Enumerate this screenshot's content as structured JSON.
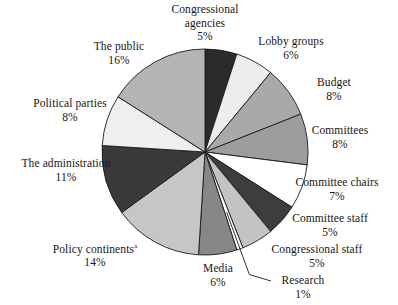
{
  "chart_data": {
    "type": "pie",
    "title": "",
    "subtitle": "",
    "xlabel": "",
    "ylabel": "",
    "legend_position": "labels-outside",
    "grid": false,
    "units": "percent",
    "total": 100,
    "start_angle_deg": 0,
    "direction": "clockwise",
    "footnote_marker": "a",
    "categories": [
      "Congressional agencies",
      "Lobby groups",
      "Budget",
      "Committees",
      "Committee chairs",
      "Committee staff",
      "Congressional staff",
      "Research",
      "Media",
      "Policy continents",
      "The administration",
      "Political parties",
      "The public"
    ],
    "values": [
      5,
      6,
      8,
      8,
      7,
      5,
      5,
      1,
      6,
      14,
      11,
      8,
      16
    ],
    "slices": [
      {
        "label": "Congressional agencies",
        "label_lines": [
          "Congressional",
          "agencies"
        ],
        "value": 5,
        "percent_text": "5%",
        "color": "#2b2b2b",
        "has_footnote": false,
        "leader_line": false,
        "label_x": 205,
        "label_y": 3,
        "label_align": "center"
      },
      {
        "label": "Lobby groups",
        "label_lines": [
          "Lobby groups"
        ],
        "value": 6,
        "percent_text": "6%",
        "color": "#ededed",
        "has_footnote": false,
        "leader_line": false,
        "label_x": 291,
        "label_y": 35,
        "label_align": "center"
      },
      {
        "label": "Budget",
        "label_lines": [
          "Budget"
        ],
        "value": 8,
        "percent_text": "8%",
        "color": "#a9a9a9",
        "has_footnote": false,
        "leader_line": false,
        "label_x": 334,
        "label_y": 76,
        "label_align": "center"
      },
      {
        "label": "Committees",
        "label_lines": [
          "Committees"
        ],
        "value": 8,
        "percent_text": "8%",
        "color": "#9d9d9d",
        "has_footnote": false,
        "leader_line": false,
        "label_x": 340,
        "label_y": 124,
        "label_align": "center"
      },
      {
        "label": "Committee chairs",
        "label_lines": [
          "Committee chairs"
        ],
        "value": 7,
        "percent_text": "7%",
        "color": "#ffffff",
        "has_footnote": false,
        "leader_line": false,
        "label_x": 337,
        "label_y": 176,
        "label_align": "center"
      },
      {
        "label": "Committee staff",
        "label_lines": [
          "Committee staff"
        ],
        "value": 5,
        "percent_text": "5%",
        "color": "#3d3d3d",
        "has_footnote": false,
        "leader_line": false,
        "label_x": 330,
        "label_y": 212,
        "label_align": "center"
      },
      {
        "label": "Congressional staff",
        "label_lines": [
          "Congressional staff"
        ],
        "value": 5,
        "percent_text": "5%",
        "color": "#c3c3c3",
        "has_footnote": false,
        "leader_line": false,
        "label_x": 317,
        "label_y": 243,
        "label_align": "center"
      },
      {
        "label": "Research",
        "label_lines": [
          "Research"
        ],
        "value": 1,
        "percent_text": "1%",
        "color": "#ffffff",
        "has_footnote": false,
        "leader_line": true,
        "label_x": 303,
        "label_y": 274,
        "label_align": "center"
      },
      {
        "label": "Media",
        "label_lines": [
          "Media"
        ],
        "value": 6,
        "percent_text": "6%",
        "color": "#878787",
        "has_footnote": false,
        "leader_line": false,
        "label_x": 218,
        "label_y": 262,
        "label_align": "center"
      },
      {
        "label": "Policy continents",
        "label_lines": [
          "Policy continents"
        ],
        "value": 14,
        "percent_text": "14%",
        "color": "#c6c6c6",
        "has_footnote": true,
        "leader_line": false,
        "label_x": 95,
        "label_y": 240,
        "label_align": "center"
      },
      {
        "label": "The administration",
        "label_lines": [
          "The administration"
        ],
        "value": 11,
        "percent_text": "11%",
        "color": "#3a3a3a",
        "has_footnote": false,
        "leader_line": false,
        "label_x": 66,
        "label_y": 157,
        "label_align": "center"
      },
      {
        "label": "Political parties",
        "label_lines": [
          "Political parties"
        ],
        "value": 8,
        "percent_text": "8%",
        "color": "#efefef",
        "has_footnote": false,
        "leader_line": false,
        "label_x": 70,
        "label_y": 97,
        "label_align": "center"
      },
      {
        "label": "The public",
        "label_lines": [
          "The public"
        ],
        "value": 16,
        "percent_text": "16%",
        "color": "#b4b4b4",
        "has_footnote": false,
        "leader_line": false,
        "label_x": 119,
        "label_y": 40,
        "label_align": "center"
      }
    ],
    "geometry": {
      "center_x": 205,
      "center_y": 152,
      "radius": 103
    },
    "stroke_color": "#1a1a1a",
    "stroke_width": 0.9,
    "background": "#ffffff"
  }
}
